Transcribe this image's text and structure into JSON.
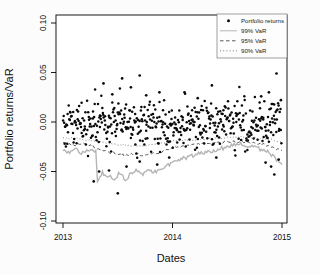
{
  "figure": {
    "bg_color": "#fcfcfc",
    "plot_bg_color": "#ffffff"
  },
  "chart_data": {
    "type": "scatter",
    "title": "",
    "xlabel": "Dates",
    "ylabel": "Portfolio returns/VaR",
    "x_ticks": [
      2013,
      2014,
      2015
    ],
    "y_ticks": [
      0.1,
      0.05,
      0.0,
      -0.05,
      -0.1
    ],
    "xlim": [
      2012.94,
      2015.05
    ],
    "ylim": [
      -0.102,
      0.108
    ],
    "grid": "off",
    "legend": {
      "position": "topright",
      "entries": [
        {
          "label": "Portfolio returns",
          "series": "returns"
        },
        {
          "label": "99% VaR",
          "series": "var99"
        },
        {
          "label": "95% VaR",
          "series": "var95"
        },
        {
          "label": "90% VaR",
          "series": "var90"
        }
      ]
    },
    "series": {
      "returns": {
        "label": "Portfolio returns",
        "marker": "filled-dot",
        "color": "#0a0a0a",
        "scatter_gen": {
          "n": 480,
          "mean": 0.0,
          "sd": 0.012,
          "seed": 1337,
          "x_range": [
            2013.0,
            2014.995
          ],
          "clip": [
            -0.047,
            0.051
          ]
        },
        "outliers": [
          [
            2013.37,
            0.039
          ],
          [
            2013.45,
            0.028
          ],
          [
            2013.54,
            0.044
          ],
          [
            2013.62,
            0.035
          ],
          [
            2013.7,
            0.047
          ],
          [
            2013.76,
            0.027
          ],
          [
            2013.88,
            0.03
          ],
          [
            2014.11,
            0.03
          ],
          [
            2014.23,
            0.024
          ],
          [
            2014.36,
            0.037
          ],
          [
            2014.81,
            0.026
          ],
          [
            2014.88,
            0.03
          ],
          [
            2014.95,
            0.049
          ],
          [
            2014.99,
            0.022
          ],
          [
            2013.28,
            -0.06
          ],
          [
            2013.33,
            -0.05
          ],
          [
            2013.42,
            -0.049
          ],
          [
            2013.5,
            -0.072
          ],
          [
            2013.58,
            -0.045
          ],
          [
            2013.7,
            -0.04
          ],
          [
            2013.86,
            -0.043
          ],
          [
            2013.97,
            -0.036
          ],
          [
            2014.4,
            -0.036
          ],
          [
            2014.85,
            -0.041
          ],
          [
            2014.9,
            -0.045
          ],
          [
            2014.93,
            -0.053
          ],
          [
            2014.97,
            -0.038
          ]
        ]
      },
      "var99": {
        "label": "99% VaR",
        "style": "solid",
        "color": "#b5b5b5",
        "width": 1.4,
        "jitter": 0.0022,
        "points": [
          [
            2013.0,
            -0.029
          ],
          [
            2013.06,
            -0.032
          ],
          [
            2013.12,
            -0.028
          ],
          [
            2013.18,
            -0.032
          ],
          [
            2013.24,
            -0.029
          ],
          [
            2013.3,
            -0.031
          ],
          [
            2013.315,
            -0.059
          ],
          [
            2013.36,
            -0.052
          ],
          [
            2013.42,
            -0.054
          ],
          [
            2013.47,
            -0.057
          ],
          [
            2013.52,
            -0.051
          ],
          [
            2013.57,
            -0.058
          ],
          [
            2013.62,
            -0.053
          ],
          [
            2013.68,
            -0.049
          ],
          [
            2013.73,
            -0.053
          ],
          [
            2013.78,
            -0.048
          ],
          [
            2013.84,
            -0.051
          ],
          [
            2013.9,
            -0.046
          ],
          [
            2013.96,
            -0.043
          ],
          [
            2014.02,
            -0.04
          ],
          [
            2014.1,
            -0.037
          ],
          [
            2014.2,
            -0.034
          ],
          [
            2014.3,
            -0.03
          ],
          [
            2014.4,
            -0.028
          ],
          [
            2014.5,
            -0.025
          ],
          [
            2014.6,
            -0.023
          ],
          [
            2014.7,
            -0.025
          ],
          [
            2014.8,
            -0.027
          ],
          [
            2014.88,
            -0.031
          ],
          [
            2014.95,
            -0.038
          ],
          [
            2015.0,
            -0.043
          ]
        ]
      },
      "var95": {
        "label": "95% VaR",
        "style": "dashed",
        "color": "#474747",
        "width": 0.9,
        "jitter": 0.0012,
        "points": [
          [
            2013.0,
            -0.021
          ],
          [
            2013.1,
            -0.023
          ],
          [
            2013.2,
            -0.022
          ],
          [
            2013.3,
            -0.026
          ],
          [
            2013.4,
            -0.03
          ],
          [
            2013.5,
            -0.032
          ],
          [
            2013.58,
            -0.034
          ],
          [
            2013.66,
            -0.032
          ],
          [
            2013.74,
            -0.034
          ],
          [
            2013.82,
            -0.032
          ],
          [
            2013.9,
            -0.03
          ],
          [
            2014.0,
            -0.026
          ],
          [
            2014.1,
            -0.024
          ],
          [
            2014.2,
            -0.023
          ],
          [
            2014.3,
            -0.022
          ],
          [
            2014.4,
            -0.021
          ],
          [
            2014.5,
            -0.02
          ],
          [
            2014.6,
            -0.02
          ],
          [
            2014.7,
            -0.021
          ],
          [
            2014.8,
            -0.022
          ],
          [
            2014.9,
            -0.025
          ],
          [
            2015.0,
            -0.029
          ]
        ]
      },
      "var90": {
        "label": "90% VaR",
        "style": "dotted",
        "color": "#7d7d7d",
        "width": 1.0,
        "jitter": 0.0009,
        "points": [
          [
            2013.0,
            -0.016
          ],
          [
            2013.15,
            -0.017
          ],
          [
            2013.3,
            -0.019
          ],
          [
            2013.45,
            -0.022
          ],
          [
            2013.6,
            -0.024
          ],
          [
            2013.75,
            -0.024
          ],
          [
            2013.9,
            -0.021
          ],
          [
            2014.0,
            -0.019
          ],
          [
            2014.15,
            -0.018
          ],
          [
            2014.3,
            -0.017
          ],
          [
            2014.45,
            -0.016
          ],
          [
            2014.6,
            -0.015
          ],
          [
            2014.75,
            -0.016
          ],
          [
            2014.9,
            -0.018
          ],
          [
            2015.0,
            -0.021
          ]
        ]
      }
    }
  }
}
